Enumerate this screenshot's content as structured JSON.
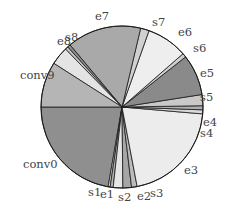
{
  "chart_data": {
    "type": "pie",
    "title": "",
    "start_angle_deg": 180,
    "direction": "clockwise_from_left_going_down",
    "slices": [
      {
        "label": "conv0",
        "value": 22.1,
        "color": "#8f8f8f"
      },
      {
        "label": "s1",
        "value": 0.4,
        "color": "#d4d4d4"
      },
      {
        "label": "e1",
        "value": 0.6,
        "color": "#b3b3b3"
      },
      {
        "label": "s2",
        "value": 1.9,
        "color": "#e6e6e6"
      },
      {
        "label": "e2",
        "value": 1.7,
        "color": "#a6a6a6"
      },
      {
        "label": "s3",
        "value": 1.1,
        "color": "#bcbcbc"
      },
      {
        "label": "e3",
        "value": 20.5,
        "color": "#ececec"
      },
      {
        "label": "s4",
        "value": 0.8,
        "color": "#d9d9d9"
      },
      {
        "label": "e4",
        "value": 0.8,
        "color": "#b0b0b0"
      },
      {
        "label": "s5",
        "value": 2.2,
        "color": "#c9c9c9"
      },
      {
        "label": "e5",
        "value": 8.1,
        "color": "#8a8a8a"
      },
      {
        "label": "s6",
        "value": 0.8,
        "color": "#cfcfcf"
      },
      {
        "label": "e6",
        "value": 8.1,
        "color": "#eeeeee"
      },
      {
        "label": "s7",
        "value": 1.7,
        "color": "#d0d0d0"
      },
      {
        "label": "e7",
        "value": 14.7,
        "color": "#a9a9a9"
      },
      {
        "label": "e8",
        "value": 0.6,
        "color": "#8c8c8c"
      },
      {
        "label": "s8",
        "value": 0.6,
        "color": "#c4c4c4"
      },
      {
        "label": "s8b",
        "value": 3.6,
        "color": "#e4e4e4",
        "hidden_label": true
      },
      {
        "label": "conv9",
        "value": 9.0,
        "color": "#b5b5b5"
      }
    ]
  }
}
